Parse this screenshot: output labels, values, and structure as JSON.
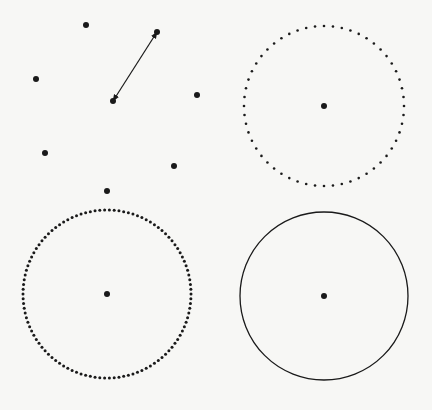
{
  "background": "#f7f7f5",
  "ink": "#1a1a1a",
  "panels": {
    "scatter": {
      "points": [
        [
          86,
          25
        ],
        [
          36,
          79
        ],
        [
          157,
          32
        ],
        [
          113,
          101
        ],
        [
          197,
          95
        ],
        [
          45,
          153
        ],
        [
          174,
          166
        ],
        [
          107,
          191
        ]
      ],
      "point_radius": 3,
      "arrow": {
        "from": [
          113,
          101
        ],
        "to": [
          157,
          32
        ],
        "double_headed": true
      }
    },
    "sparse_dotted_circle": {
      "center": [
        324,
        106
      ],
      "radius": 80,
      "dot_count": 56,
      "dot_radius": 1.3,
      "center_radius": 3
    },
    "dense_dotted_circle": {
      "center": [
        107,
        294
      ],
      "radius": 84,
      "dot_count": 110,
      "dot_radius": 1.5,
      "center_radius": 3
    },
    "solid_circle": {
      "center": [
        324,
        296
      ],
      "radius": 84,
      "stroke_width": 1.3,
      "center_radius": 3
    }
  }
}
